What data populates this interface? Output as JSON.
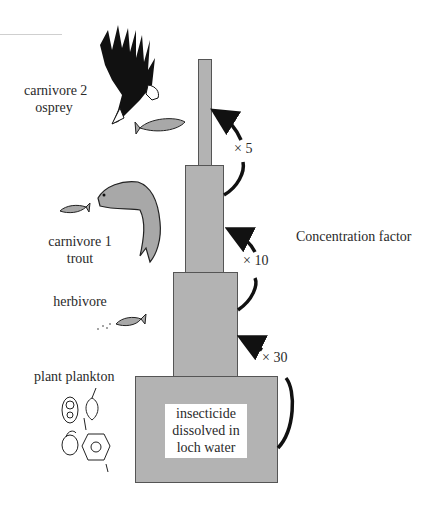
{
  "title": "Concentration factor",
  "levels": [
    {
      "name": "carnivore 2",
      "organism": "osprey"
    },
    {
      "name": "carnivore 1",
      "organism": "trout"
    },
    {
      "name": "herbivore",
      "organism": ""
    },
    {
      "name": "plant plankton",
      "organism": ""
    }
  ],
  "base_label": {
    "line1": "insecticide",
    "line2": "dissolved in",
    "line3": "loch water"
  },
  "factors": [
    {
      "label": "× 30"
    },
    {
      "label": "× 10"
    },
    {
      "label": "× 5"
    }
  ],
  "colors": {
    "box_fill": "#b3b3b3",
    "box_border": "#555555",
    "arrow": "#111111"
  }
}
